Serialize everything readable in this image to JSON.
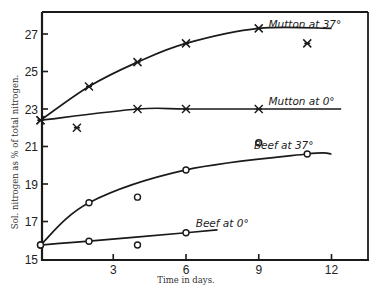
{
  "chart_data": {
    "type": "line",
    "title": "",
    "xlabel": "Time in days.",
    "ylabel": "Sol. nitrogen as % of total nitrogen.",
    "xlim": [
      0,
      13.5
    ],
    "ylim": [
      15,
      28.2
    ],
    "x_ticks": [
      3,
      6,
      9,
      12
    ],
    "x_tick_labels": [
      "3",
      "6",
      "9",
      "12"
    ],
    "y_ticks": [
      15,
      17,
      19,
      21,
      23,
      25,
      27
    ],
    "y_tick_labels": [
      "15",
      "17",
      "19",
      "21",
      "23",
      "25",
      "27"
    ],
    "grid": false,
    "legend_position": "inline labels at end of curves",
    "series": [
      {
        "name": "Mutton at 37°",
        "marker": "x",
        "curve": [
          [
            0,
            22.4
          ],
          [
            2,
            24.2
          ],
          [
            4,
            25.5
          ],
          [
            6,
            26.5
          ],
          [
            9,
            27.3
          ],
          [
            12,
            27.3
          ]
        ],
        "points": [
          [
            0,
            22.4
          ],
          [
            2,
            24.2
          ],
          [
            4,
            25.5
          ],
          [
            6,
            26.5
          ],
          [
            9,
            27.3
          ]
        ],
        "outliers": [
          [
            11,
            26.5
          ]
        ],
        "label_pos": [
          9.4,
          27.3
        ]
      },
      {
        "name": "Mutton at 0°",
        "marker": "x",
        "curve": [
          [
            0,
            22.4
          ],
          [
            4,
            23.0
          ],
          [
            6,
            23.0
          ],
          [
            9,
            23.0
          ],
          [
            12.4,
            23.0
          ]
        ],
        "points": [
          [
            0,
            22.4
          ],
          [
            4,
            23.0
          ],
          [
            6,
            23.0
          ],
          [
            9,
            23.0
          ]
        ],
        "outliers": [
          [
            1.5,
            22.0
          ]
        ],
        "label_pos": [
          9.4,
          23.2
        ]
      },
      {
        "name": "Beef at 37°",
        "marker": "o",
        "curve": [
          [
            0,
            15.75
          ],
          [
            2,
            18.0
          ],
          [
            6,
            19.75
          ],
          [
            11,
            20.6
          ],
          [
            12,
            20.6
          ]
        ],
        "points": [
          [
            0,
            15.75
          ],
          [
            2,
            18.0
          ],
          [
            6,
            19.75
          ],
          [
            11,
            20.6
          ]
        ],
        "outliers": [
          [
            4,
            18.3
          ],
          [
            9,
            21.2
          ]
        ],
        "label_pos": [
          8.8,
          20.85
        ]
      },
      {
        "name": "Beef at 0°",
        "marker": "o",
        "curve": [
          [
            0,
            15.75
          ],
          [
            2,
            15.95
          ],
          [
            6,
            16.4
          ],
          [
            7.3,
            16.55
          ]
        ],
        "points": [
          [
            0,
            15.75
          ],
          [
            2,
            15.95
          ],
          [
            6,
            16.4
          ]
        ],
        "outliers": [
          [
            4,
            15.75
          ]
        ],
        "label_pos": [
          6.4,
          16.7
        ]
      }
    ]
  },
  "layout": {
    "plot_left": 42,
    "plot_right": 368,
    "plot_top": 12,
    "plot_bottom": 260,
    "x0_px": 40.5,
    "px_per_day": 24.25,
    "y15_px": 259,
    "px_per_unit": 18.75
  }
}
